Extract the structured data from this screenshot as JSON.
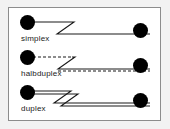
{
  "diagram": {
    "title": "",
    "background_color": "#f2f2f2",
    "frame_color": "#8c8c8c",
    "node_color": "#000000",
    "line_color": "#1a1a1a",
    "rows": [
      {
        "id": "simplex",
        "label": "simplex",
        "channels": 1,
        "line_style": "solid",
        "direction": "one-way",
        "zigzag_count": 1,
        "left_node": "station-node",
        "right_node": "station-node"
      },
      {
        "id": "halbduplex",
        "label": "halbduplex",
        "channels": 2,
        "line_style": "dashed",
        "direction": "alternating-two-way",
        "zigzag_count": 1,
        "left_node": "station-node",
        "right_node": "station-node"
      },
      {
        "id": "duplex",
        "label": "duplex",
        "channels": 2,
        "line_style": "solid",
        "direction": "simultaneous-two-way",
        "zigzag_count": 2,
        "left_node": "station-node",
        "right_node": "station-node"
      }
    ]
  }
}
